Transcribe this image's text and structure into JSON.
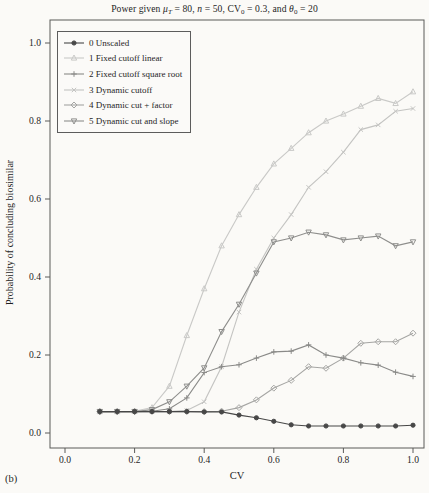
{
  "page": {
    "corner_label": "(b)"
  },
  "chart_data": {
    "type": "line",
    "title_plain": "Power given μT = 80, n = 50, CV0 = 0.3, and θ0 = 20",
    "title_parts": [
      {
        "t": "Power given "
      },
      {
        "t": "μ",
        "i": 1
      },
      {
        "t": "T",
        "sub": 1,
        "i": 1
      },
      {
        "t": " = 80, "
      },
      {
        "t": "n",
        "i": 1
      },
      {
        "t": " = 50, CV"
      },
      {
        "t": "0",
        "sub": 1
      },
      {
        "t": " = 0.3, and "
      },
      {
        "t": "θ",
        "i": 1
      },
      {
        "t": "0",
        "sub": 1
      },
      {
        "t": " = 20"
      }
    ],
    "xlabel": "CV",
    "ylabel": "Probability of concluding biosimilar",
    "xlim": [
      0.0,
      1.0
    ],
    "ylim": [
      0.0,
      1.0
    ],
    "x_tick_values": [
      0.0,
      0.2,
      0.4,
      0.6,
      0.8,
      1.0
    ],
    "x_tick_labels": [
      "0.0",
      "0.2",
      "0.4",
      "0.6",
      "0.8",
      "1.0"
    ],
    "y_tick_values": [
      0.0,
      0.2,
      0.4,
      0.6,
      0.8,
      1.0
    ],
    "y_tick_labels": [
      "0.0",
      "0.2",
      "0.4",
      "0.6",
      "0.8",
      "1.0"
    ],
    "grid": false,
    "legend_position": "upper-left-inside",
    "x": [
      0.1,
      0.15,
      0.2,
      0.25,
      0.3,
      0.35,
      0.4,
      0.45,
      0.5,
      0.55,
      0.6,
      0.65,
      0.7,
      0.75,
      0.8,
      0.85,
      0.9,
      0.95,
      1.0
    ],
    "series": [
      {
        "name": "0 Unscaled",
        "marker": "circle-filled",
        "color": "#474747",
        "values": [
          0.055,
          0.055,
          0.055,
          0.055,
          0.055,
          0.055,
          0.054,
          0.054,
          0.046,
          0.039,
          0.03,
          0.021,
          0.018,
          0.018,
          0.018,
          0.018,
          0.018,
          0.018,
          0.02
        ]
      },
      {
        "name": "1 Fixed cutoff linear",
        "marker": "triangle-up",
        "color": "#c9c9c7",
        "values": [
          0.055,
          0.055,
          0.056,
          0.065,
          0.12,
          0.25,
          0.37,
          0.48,
          0.56,
          0.63,
          0.69,
          0.73,
          0.77,
          0.8,
          0.818,
          0.838,
          0.858,
          0.845,
          0.875
        ]
      },
      {
        "name": "2 Fixed cutoff square root",
        "marker": "plus",
        "color": "#8a8a88",
        "values": [
          0.055,
          0.055,
          0.055,
          0.056,
          0.062,
          0.09,
          0.155,
          0.17,
          0.175,
          0.192,
          0.208,
          0.21,
          0.226,
          0.2,
          0.192,
          0.18,
          0.174,
          0.156,
          0.145
        ]
      },
      {
        "name": "3 Dynamic cutoff",
        "marker": "x",
        "color": "#c4c4c2",
        "values": [
          0.055,
          0.055,
          0.055,
          0.055,
          0.055,
          0.058,
          0.08,
          0.17,
          0.31,
          0.42,
          0.5,
          0.56,
          0.63,
          0.67,
          0.72,
          0.778,
          0.79,
          0.825,
          0.832
        ]
      },
      {
        "name": "4 Dynamic cut + factor",
        "marker": "diamond",
        "color": "#a5a5a3",
        "values": [
          0.055,
          0.055,
          0.055,
          0.055,
          0.055,
          0.055,
          0.055,
          0.056,
          0.065,
          0.085,
          0.115,
          0.135,
          0.17,
          0.166,
          0.192,
          0.23,
          0.234,
          0.234,
          0.256
        ]
      },
      {
        "name": "5 Dynamic cut and slope",
        "marker": "triangle-down",
        "color": "#8e8e8c",
        "values": [
          0.055,
          0.055,
          0.055,
          0.06,
          0.08,
          0.12,
          0.167,
          0.26,
          0.33,
          0.41,
          0.49,
          0.5,
          0.515,
          0.508,
          0.495,
          0.5,
          0.505,
          0.48,
          0.49
        ]
      }
    ]
  }
}
